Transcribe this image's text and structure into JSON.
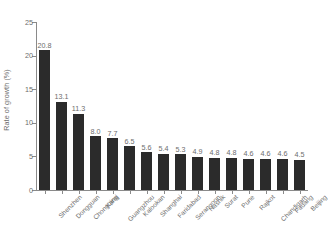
{
  "chart_data": {
    "type": "bar",
    "title": "",
    "subtitle": "",
    "xlabel": "",
    "ylabel": "Rate of growth (%)",
    "ylim": [
      0,
      25
    ],
    "yticks": [
      0,
      5,
      10,
      15,
      20,
      25
    ],
    "ytick_labels": [
      "0",
      "5",
      "10",
      "15",
      "20",
      "25"
    ],
    "grid": false,
    "legend": null,
    "bar_color": "#2b2b2b",
    "axis_color": "#8a8a8a",
    "text_color": "#6d6d6d",
    "background": "#ffffff",
    "categories": [
      "Shenzhen",
      "Dongguan",
      "Chongqing",
      "Karaj",
      "Guangzhou",
      "Kalookan",
      "Shanghai",
      "Faridabad",
      "Serangoon",
      "Nashik",
      "Surat",
      "Pune",
      "Rajkot",
      "Chandigarh",
      "Padang",
      "Beijing"
    ],
    "values": [
      20.8,
      13.1,
      11.3,
      8.0,
      7.7,
      6.5,
      5.6,
      5.4,
      5.3,
      4.9,
      4.8,
      4.8,
      4.6,
      4.6,
      4.6,
      4.5
    ],
    "value_labels": [
      "20.8",
      "13.1",
      "11.3",
      "8.0",
      "7.7",
      "6.5",
      "5.6",
      "5.4",
      "5.3",
      "4.9",
      "4.8",
      "4.8",
      "4.6",
      "4.6",
      "4.6",
      "4.5"
    ]
  }
}
